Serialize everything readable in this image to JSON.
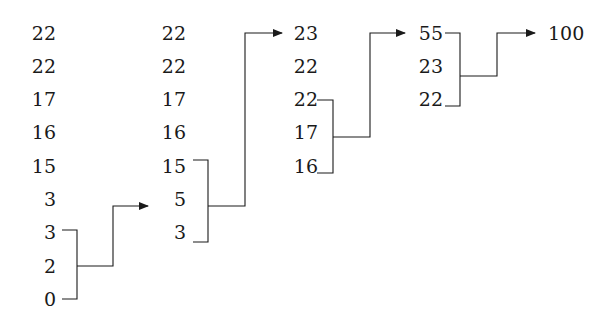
{
  "columns": [
    {
      "values": [
        "22",
        "22",
        "17",
        "16",
        "15",
        "3",
        "3",
        "2",
        "0"
      ]
    },
    {
      "values": [
        "22",
        "22",
        "17",
        "16",
        "15",
        "5",
        "3"
      ]
    },
    {
      "values": [
        "23",
        "22",
        "22",
        "17",
        "16"
      ]
    },
    {
      "values": [
        "55",
        "23",
        "22"
      ]
    },
    {
      "values": [
        "100"
      ]
    }
  ],
  "merges": [
    {
      "from_column": 1,
      "merged": [
        "3",
        "2",
        "0"
      ],
      "result": "5"
    },
    {
      "from_column": 2,
      "merged": [
        "15",
        "5",
        "3"
      ],
      "result": "23"
    },
    {
      "from_column": 3,
      "merged": [
        "22",
        "17",
        "16"
      ],
      "result": "55"
    },
    {
      "from_column": 4,
      "merged": [
        "55",
        "23",
        "22"
      ],
      "result": "100"
    }
  ],
  "colors": {
    "line": "#1a1a1a",
    "text": "#1a1a1a",
    "background": "#ffffff"
  }
}
